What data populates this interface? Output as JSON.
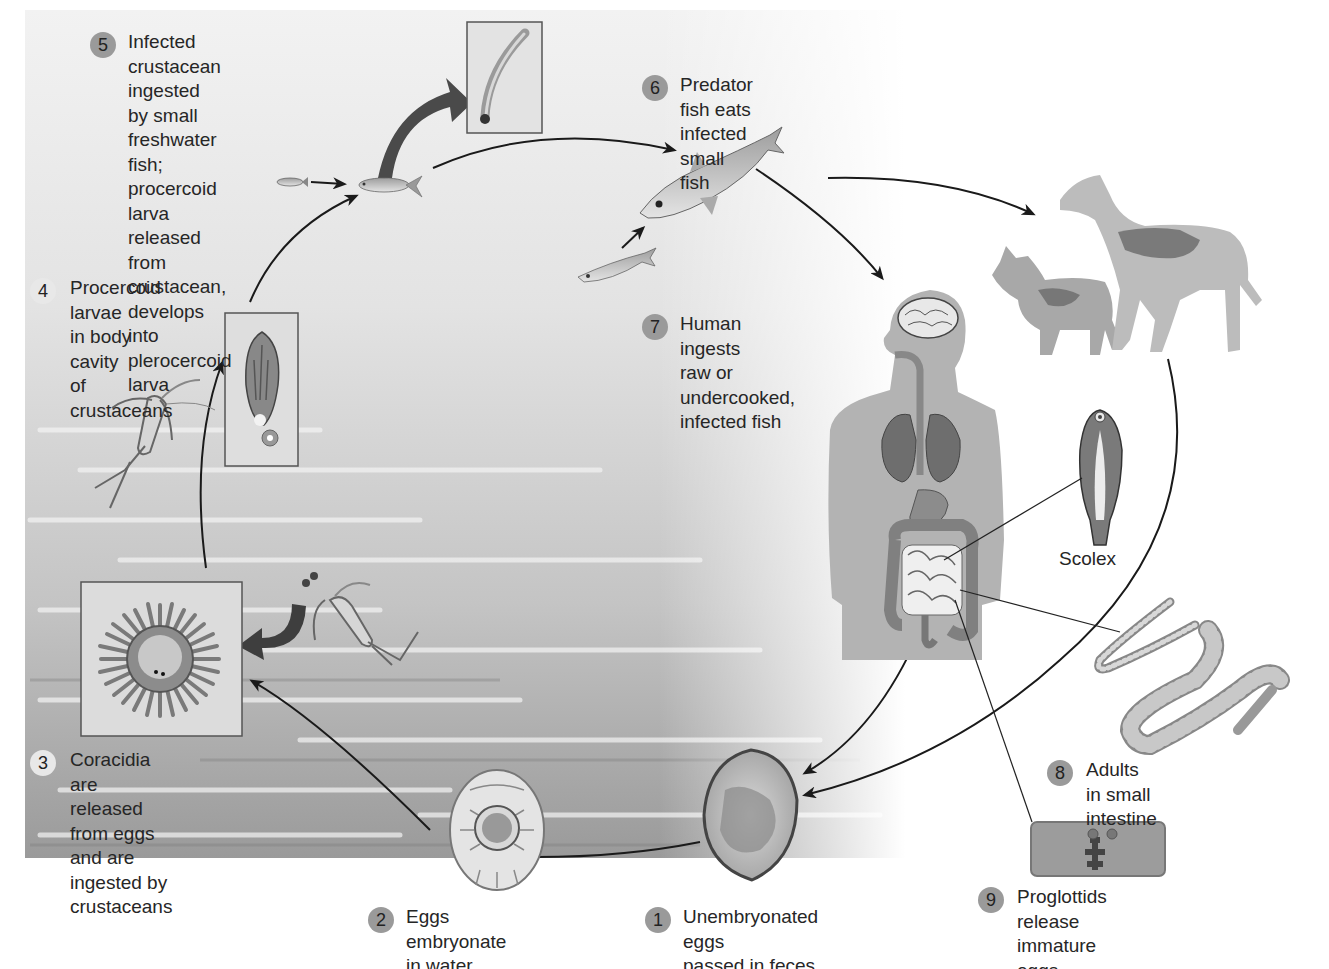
{
  "figure": {
    "colors": {
      "water_dark": "#8e8e8e",
      "water_light": "#e6e6e6",
      "badge": "#9a9a9a",
      "badge_light": "#e8e8e8",
      "arrow": "#1a1a1a",
      "host_silhouette": "#b3b3b3",
      "text": "#262626"
    }
  },
  "steps": [
    {
      "number": "1",
      "text": "Unembryonated eggs\npassed in feces"
    },
    {
      "number": "2",
      "text": "Eggs embryonate\nin water"
    },
    {
      "number": "3",
      "text": "Coracidia are released\nfrom eggs and are\ningested by crustaceans"
    },
    {
      "number": "4",
      "text": "Procercoid larvae\nin body cavity\nof crustaceans"
    },
    {
      "number": "5",
      "text": "Infected crustacean ingested\nby small freshwater fish;\nprocercoid larva released from\ncrustacean, develops into\nplerocercoid larva"
    },
    {
      "number": "6",
      "text": "Predator fish eats\ninfected small fish"
    },
    {
      "number": "7",
      "text": "Human ingests\nraw or undercooked,\ninfected fish"
    },
    {
      "number": "8",
      "text": "Adults in small intestine"
    },
    {
      "number": "9",
      "text": "Proglottids release\nimmature eggs"
    }
  ],
  "callouts": {
    "scolex": "Scolex"
  },
  "illustrations": [
    "unembryonated-egg",
    "embryonated-egg",
    "coracidium",
    "copepod-crustacean",
    "procercoid-larva",
    "plerocercoid-larva",
    "small-fish",
    "predator-fish",
    "human-body",
    "cat",
    "dog",
    "scolex",
    "adult-tapeworm",
    "proglottid"
  ]
}
